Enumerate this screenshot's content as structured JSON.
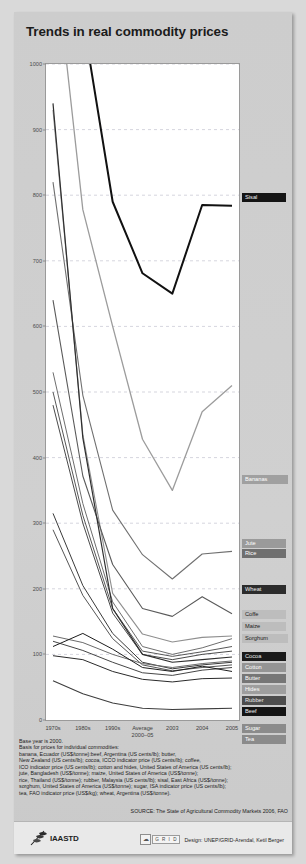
{
  "title": "Trends in real commodity prices",
  "chart_data": {
    "type": "line",
    "title": "Trends in real commodity prices",
    "xlabel": "",
    "ylabel": "",
    "ylim": [
      0,
      1000
    ],
    "grid": true,
    "legend_position": "right",
    "categories": [
      "1970s",
      "1980s",
      "1990s",
      "Average 2000–05",
      "2003",
      "2004",
      "2005"
    ],
    "x_tick_labels": [
      "1970s",
      "1980s",
      "1990s",
      "Average\n2000–05",
      "2003",
      "2004",
      "2005"
    ],
    "y_tick_labels": [
      "0",
      "100",
      "200",
      "300",
      "400",
      "500",
      "600",
      "700",
      "800",
      "900",
      "1000"
    ],
    "series": [
      {
        "name": "Sisal",
        "color": "#111111",
        "width": 2.0,
        "values": [
          1480,
          1070,
          790,
          681,
          650,
          785,
          784
        ]
      },
      {
        "name": "Bananas",
        "color": "#9c9c9c",
        "width": 1.3,
        "values": [
          1190,
          778,
          600,
          428,
          350,
          470,
          510
        ]
      },
      {
        "name": "Jute",
        "color": "#8f8f8f",
        "width": 1.1,
        "values": [
          930,
          435,
          193,
          131,
          119,
          126,
          128
        ]
      },
      {
        "name": "Rice",
        "color": "#707070",
        "width": 1.1,
        "values": [
          820,
          495,
          320,
          252,
          215,
          253,
          257
        ]
      },
      {
        "name": "Wheat",
        "color": "#5a5a5a",
        "width": 1.1,
        "values": [
          640,
          372,
          237,
          170,
          158,
          188,
          162
        ]
      },
      {
        "name": "Coffe",
        "color": "#6e6e6e",
        "width": 1.0,
        "values": [
          530,
          330,
          180,
          112,
          100,
          110,
          124
        ]
      },
      {
        "name": "Maize",
        "color": "#585858",
        "width": 1.0,
        "values": [
          500,
          312,
          170,
          105,
          97,
          104,
          112
        ]
      },
      {
        "name": "Sorghum",
        "color": "#4a4a4a",
        "width": 1.0,
        "values": [
          480,
          300,
          163,
          100,
          92,
          100,
          105
        ]
      },
      {
        "name": "Cocoa",
        "color": "#2f2f2f",
        "width": 1.2,
        "values": [
          940,
          430,
          170,
          100,
          88,
          92,
          96
        ]
      },
      {
        "name": "Cotton",
        "color": "#3a3a3a",
        "width": 1.0,
        "values": [
          315,
          205,
          132,
          88,
          78,
          84,
          88
        ]
      },
      {
        "name": "Butter",
        "color": "#555555",
        "width": 1.0,
        "values": [
          290,
          190,
          124,
          84,
          75,
          80,
          84
        ]
      },
      {
        "name": "Hides",
        "color": "#6a6a6a",
        "width": 1.0,
        "values": [
          128,
          118,
          100,
          86,
          80,
          86,
          90
        ]
      },
      {
        "name": "Rubber",
        "color": "#464646",
        "width": 1.0,
        "values": [
          120,
          106,
          88,
          72,
          68,
          76,
          80
        ]
      },
      {
        "name": "Beef",
        "color": "#1d1d1d",
        "width": 1.0,
        "values": [
          112,
          132,
          108,
          80,
          74,
          82,
          74
        ]
      },
      {
        "name": "Sugar",
        "color": "#3d3d3d",
        "width": 1.1,
        "values": [
          60,
          40,
          26,
          18,
          16,
          17,
          18
        ]
      },
      {
        "name": "Tea",
        "color": "#2a2a2a",
        "width": 1.0,
        "values": [
          98,
          92,
          74,
          62,
          58,
          63,
          64
        ]
      }
    ]
  },
  "legend": [
    {
      "label": "Sisal",
      "y": 181,
      "bg": "#151515",
      "fg": "#f3f3f3"
    },
    {
      "label": "Bananas",
      "y": 463,
      "bg": "#a0a0a0",
      "fg": "#ffffff"
    },
    {
      "label": "Jute",
      "y": 527,
      "bg": "#9a9a9a",
      "fg": "#ffffff"
    },
    {
      "label": "Rice",
      "y": 537,
      "bg": "#6f6f6f",
      "fg": "#ffffff"
    },
    {
      "label": "Wheat",
      "y": 573,
      "bg": "#2c2c2c",
      "fg": "#f0f0f0"
    },
    {
      "label": "Coffe",
      "y": 598,
      "bg": "#bdbdbd",
      "fg": "#1b1b1b"
    },
    {
      "label": "Maize",
      "y": 610,
      "bg": "#bdbdbd",
      "fg": "#1b1b1b"
    },
    {
      "label": "Sorghum",
      "y": 622,
      "bg": "#bdbdbd",
      "fg": "#1b1b1b"
    },
    {
      "label": "Cocoa",
      "y": 640,
      "bg": "#1a1a1a",
      "fg": "#e8e8e8"
    },
    {
      "label": "Cotton",
      "y": 651,
      "bg": "#949494",
      "fg": "#ffffff"
    },
    {
      "label": "Butter",
      "y": 662,
      "bg": "#767676",
      "fg": "#ffffff"
    },
    {
      "label": "Hides",
      "y": 673,
      "bg": "#9e9e9e",
      "fg": "#ffffff"
    },
    {
      "label": "Rubber",
      "y": 684,
      "bg": "#4d4d4d",
      "fg": "#e9e9e9"
    },
    {
      "label": "Beef",
      "y": 695,
      "bg": "#141414",
      "fg": "#efefef"
    },
    {
      "label": "Sugar",
      "y": 712,
      "bg": "#8b8b8b",
      "fg": "#ffffff"
    },
    {
      "label": "Tea",
      "y": 723,
      "bg": "#8b8b8b",
      "fg": "#ffffff"
    }
  ],
  "notes": [
    "Base year is 2000.",
    "Basis for prices for individual commodities:",
    "banana, Ecuador (US$/tonne):beef, Argentina (US cents/lb); butter,",
    "New Zealand (US cents/lb); cocoa, ICCO indicator price (US cents/lb); coffee,",
    "ICO indicator price (US cents/lb); cotton and hides, United States of America (US cents/lb);",
    "jute, Bangladesh (US$/tonne); maize, United States of America (US$/tonne);",
    "rice, Thailand (US$/tonne); rubber, Malaysia (US cents/lb); sisal, East Africa (US$/tonne);",
    "sorghum, United States of America (US$/tonne); sugar, ISA indicator price (US cents/lb);",
    "tea, FAO indicator price (US$/kg); wheat, Argentina (US$/tonne)."
  ],
  "source": "SOURCE: The State of Agricultural Commodity Markets 2006, FAO",
  "footer": {
    "logo_text": "IAASTD",
    "design_credit": "Design: UNEP/GRID-Arendal, Ketil Berger",
    "unep_mark": "UNEP",
    "grid_mark": "G R I D"
  }
}
